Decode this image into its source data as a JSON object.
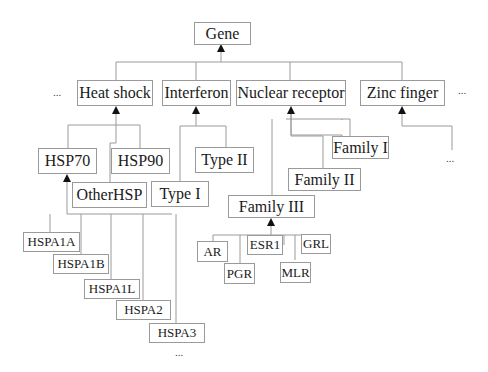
{
  "diagram": {
    "root": "Gene",
    "categories": {
      "heat_shock": "Heat shock",
      "interferon": "Interferon",
      "nuclear_receptor": "Nuclear receptor",
      "zinc_finger": "Zinc finger"
    },
    "heat_shock_children": {
      "hsp70": "HSP70",
      "hsp90": "HSP90",
      "other_hsp": "OtherHSP"
    },
    "hsp70_children": [
      "HSPA1A",
      "HSPA1B",
      "HSPA1L",
      "HSPA2",
      "HSPA3"
    ],
    "interferon_children": {
      "type_i": "Type I",
      "type_ii": "Type II"
    },
    "nuclear_receptor_children": {
      "family_i": "Family I",
      "family_ii": "Family II",
      "family_iii": "Family III"
    },
    "family_iii_children": [
      "AR",
      "PGR",
      "ESR1",
      "MLR",
      "GRL"
    ],
    "ellipsis": "..."
  }
}
